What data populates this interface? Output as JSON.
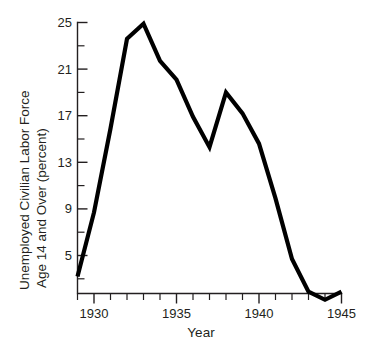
{
  "chart_data": {
    "type": "line",
    "title": "",
    "xlabel": "Year",
    "ylabel": "Unemployed Civilian Labor Force Age 14 and Over (percent)",
    "ylabel_line1": "Unemployed Civilian Labor Force",
    "ylabel_line2": "Age 14 and Over (percent)",
    "x": [
      1929,
      1930,
      1931,
      1932,
      1933,
      1934,
      1935,
      1936,
      1937,
      1938,
      1939,
      1940,
      1941,
      1942,
      1943,
      1944,
      1945
    ],
    "values": [
      3.2,
      8.7,
      15.9,
      23.6,
      24.9,
      21.7,
      20.1,
      16.9,
      14.3,
      19.0,
      17.2,
      14.6,
      9.9,
      4.7,
      1.9,
      1.2,
      1.9
    ],
    "series": [
      {
        "name": "Unemployment rate",
        "values": [
          3.2,
          8.7,
          15.9,
          23.6,
          24.9,
          21.7,
          20.1,
          16.9,
          14.3,
          19.0,
          17.2,
          14.6,
          9.9,
          4.7,
          1.9,
          1.2,
          1.9
        ]
      }
    ],
    "xlim": [
      1929,
      1945
    ],
    "ylim": [
      0.6,
      25
    ],
    "xticks": [
      1929,
      1930,
      1931,
      1932,
      1933,
      1934,
      1935,
      1936,
      1937,
      1938,
      1939,
      1940,
      1941,
      1942,
      1943,
      1944,
      1945
    ],
    "xtick_labels_shown": [
      {
        "value": 1930,
        "label": "1930"
      },
      {
        "value": 1935,
        "label": "1935"
      },
      {
        "value": 1940,
        "label": "1940"
      },
      {
        "value": 1945,
        "label": "1945"
      }
    ],
    "yticks_major": [
      {
        "value": 25,
        "label": "25"
      },
      {
        "value": 21,
        "label": "21"
      },
      {
        "value": 17,
        "label": "17"
      },
      {
        "value": 13,
        "label": "13"
      },
      {
        "value": 9,
        "label": "9"
      },
      {
        "value": 5,
        "label": "5"
      }
    ],
    "yticks_minor": [
      23,
      19,
      15,
      11,
      7,
      3
    ],
    "grid": false,
    "legend": false,
    "legend_position": "none",
    "line_color": "#000000",
    "axis_color": "#231f20",
    "background_color": "#ffffff"
  }
}
